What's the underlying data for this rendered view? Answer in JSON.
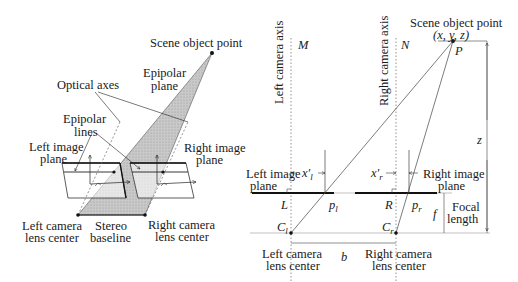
{
  "left_diagram": {
    "title_labels": {
      "scene_object_point": "Scene object point",
      "epipolar_plane": [
        "Epipolar",
        "plane"
      ],
      "optical_axes": "Optical axes",
      "epipolar_lines": [
        "Epipolar",
        "lines"
      ],
      "left_image_plane": [
        "Left image",
        "plane"
      ],
      "right_image_plane": [
        "Right image",
        "plane"
      ],
      "left_camera_lens_center": [
        "Left camera",
        "lens center"
      ],
      "stereo_baseline": [
        "Stereo",
        "baseline"
      ],
      "right_camera_lens_center": [
        "Right camera",
        "lens center"
      ]
    },
    "colors": {
      "plane_fill": "#c8c8c8",
      "line": "#222222"
    }
  },
  "right_diagram": {
    "labels": {
      "scene_object_point": "Scene object point",
      "coords": "(x, y, z)",
      "P": "P",
      "M": "M",
      "N": "N",
      "left_camera_axis": "Left camera axis",
      "right_camera_axis": "Right camera axis",
      "left_image_plane": [
        "Left image",
        "plane"
      ],
      "right_image_plane": [
        "Right image",
        "plane"
      ],
      "x_l": "x′",
      "x_l_sub": "l",
      "x_r": "x′",
      "x_r_sub": "r",
      "L": "L",
      "R": "R",
      "p_l": "p",
      "p_l_sub": "l",
      "p_r": "p",
      "p_r_sub": "r",
      "C_l": "C",
      "C_l_sub": "l",
      "C_r": "C",
      "C_r_sub": "r",
      "f": "f",
      "focal_length": [
        "Focal",
        "length"
      ],
      "z": "z",
      "b": "b",
      "left_camera_lens_center": [
        "Left camera",
        "lens center"
      ],
      "right_camera_lens_center": [
        "Right camera",
        "lens center"
      ]
    }
  }
}
